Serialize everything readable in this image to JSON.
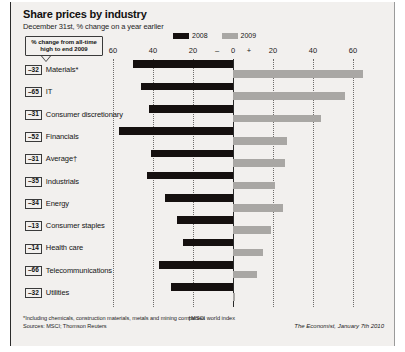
{
  "title": "Share prices by industry",
  "subtitle": "December 31st, % change on a year earlier",
  "callout": {
    "line1": "% change from all-time",
    "line2": "high to end 2009"
  },
  "legend": [
    {
      "label": "2008",
      "color": "#15100f"
    },
    {
      "label": "2009",
      "color": "#a9a7a4"
    }
  ],
  "footnotes": {
    "asterisk": "*Including chemicals, construction materials, metals and mining companies",
    "dagger": "†MSCI world index",
    "sources": "Sources: MSCI; Thomson Reuters"
  },
  "credit": "The Economist, January 7th 2010",
  "chart_data": {
    "type": "bar",
    "orientation": "horizontal",
    "title": "Share prices by industry",
    "subtitle": "December 31st, % change on a year earlier",
    "xlabel": "",
    "ylabel": "",
    "xlim": [
      -60,
      60
    ],
    "xticks": [
      -60,
      -40,
      -20,
      0,
      20,
      40,
      60
    ],
    "xtick_labels": [
      "60",
      "40",
      "20",
      "–",
      "0",
      "+",
      "20",
      "40",
      "60"
    ],
    "grid": true,
    "legend_position": "top-center",
    "categories": [
      "Materials*",
      "IT",
      "Consumer discretionary",
      "Financials",
      "Average†",
      "Industrials",
      "Energy",
      "Consumer staples",
      "Health care",
      "Telecommunications",
      "Utilities"
    ],
    "series": [
      {
        "name": "2008",
        "color": "#15100f",
        "values": [
          -50,
          -46,
          -42,
          -57,
          -41,
          -43,
          -34,
          -28,
          -25,
          -37,
          -31
        ]
      },
      {
        "name": "2009",
        "color": "#a9a7a4",
        "values": [
          65,
          56,
          44,
          27,
          26,
          21,
          25,
          19,
          15,
          12,
          1
        ]
      }
    ],
    "chips_label": "% change from all-time high to end 2009",
    "chips": [
      -32,
      -65,
      -31,
      -52,
      -31,
      -35,
      -34,
      -13,
      -14,
      -66,
      -32
    ]
  }
}
